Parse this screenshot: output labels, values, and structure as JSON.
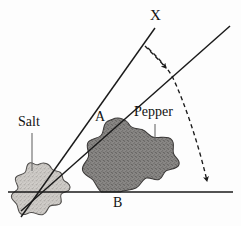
{
  "figure": {
    "background_color": "#fdfdfd",
    "ink_color": "#1a1a1a",
    "width": 241,
    "height": 226
  },
  "labels": {
    "ray_top": "X",
    "vertex_upper": "A",
    "baseline": "B",
    "blob_light": "Salt",
    "blob_dark": "Pepper"
  },
  "blobs": {
    "salt": {
      "name": "Salt",
      "fill_color": "#c9c6c2",
      "stroke_color": "#4a4a4a",
      "texture": "stipple-light"
    },
    "pepper": {
      "name": "Pepper",
      "fill_color": "#7e7c7a",
      "stroke_color": "#3a3a3a",
      "texture": "stipple-dark"
    }
  },
  "geometry": {
    "vertex": {
      "x": 38,
      "y": 192
    },
    "baseline": {
      "x1": 8,
      "y1": 192,
      "x2": 233,
      "y2": 192
    },
    "ray_x": {
      "x1": 22,
      "y1": 215,
      "x2": 155,
      "y2": 28
    },
    "ray_lower": {
      "x1": 22,
      "y1": 210,
      "x2": 229,
      "y2": 27
    },
    "arc": {
      "style": "dashed",
      "from_label": "X",
      "to_label": "B",
      "arrowheads": 2,
      "arrow_mid": {
        "x": 168,
        "y": 71
      },
      "arrow_end": {
        "x": 208,
        "y": 190
      }
    }
  },
  "leaders": {
    "salt": {
      "x1": 32,
      "y1": 133,
      "x2": 32,
      "y2": 170
    },
    "pepper": {
      "x1": 155,
      "y1": 124,
      "x2": 155,
      "y2": 140
    }
  }
}
